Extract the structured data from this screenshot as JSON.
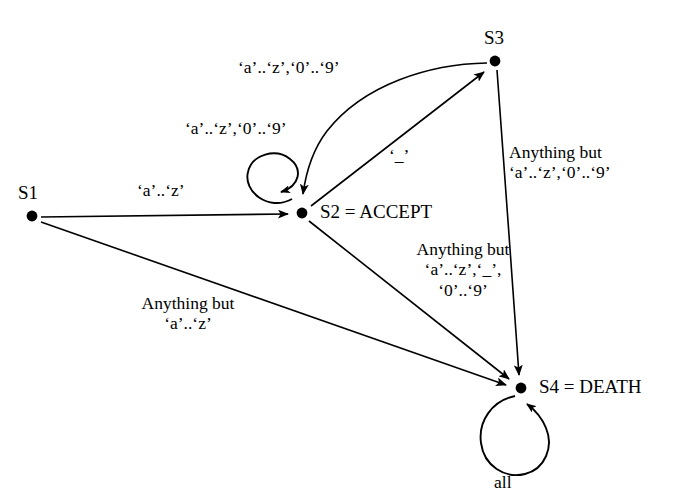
{
  "diagram": {
    "kind": "state-transition-diagram",
    "background_color": "#ffffff",
    "stroke_color": "#000000",
    "nodes": [
      {
        "id": "S1",
        "label": "S1",
        "x": 32,
        "y": 216
      },
      {
        "id": "S2",
        "label": "S2 = ACCEPT",
        "x": 302,
        "y": 213
      },
      {
        "id": "S3",
        "label": "S3",
        "x": 495,
        "y": 61
      },
      {
        "id": "S4",
        "label": "S4 = DEATH",
        "x": 521,
        "y": 388
      }
    ],
    "edges": [
      {
        "id": "s1-s2",
        "from": "S1",
        "to": "S2",
        "label_lines": [
          "‘a’..‘z’"
        ]
      },
      {
        "id": "s1-s4",
        "from": "S1",
        "to": "S4",
        "label_lines": [
          "Anything but",
          "‘a’..‘z’"
        ]
      },
      {
        "id": "s2-self",
        "from": "S2",
        "to": "S2",
        "label_lines": [
          "‘a’..‘z’,‘0’..‘9’"
        ]
      },
      {
        "id": "s2-s3",
        "from": "S2",
        "to": "S3",
        "label_lines": [
          "‘_’"
        ]
      },
      {
        "id": "s3-s2",
        "from": "S3",
        "to": "S2",
        "label_lines": [
          "‘a’..‘z’,‘0’..‘9’"
        ]
      },
      {
        "id": "s2-s4",
        "from": "S2",
        "to": "S4",
        "label_lines": [
          "Anything but",
          "‘a’..‘z’,‘_’,",
          "‘0’..‘9’"
        ]
      },
      {
        "id": "s3-s4",
        "from": "S3",
        "to": "S4",
        "label_lines": [
          "Anything but",
          "‘a’..‘z’,‘0’..‘9’"
        ]
      },
      {
        "id": "s4-self",
        "from": "S4",
        "to": "S4",
        "label_lines": [
          "all"
        ]
      }
    ],
    "labels": {
      "node_s1": "S1",
      "node_s2": "S2 = ACCEPT",
      "node_s3": "S3",
      "node_s4": "S4 = DEATH",
      "edge_s1_s2": "‘a’..‘z’",
      "edge_s1_s4_line1": "Anything but",
      "edge_s1_s4_line2": "‘a’..‘z’",
      "edge_s2_self": "‘a’..‘z’,‘0’..‘9’",
      "edge_s3_s2": "‘a’..‘z’,‘0’..‘9’",
      "edge_s2_s3": "‘_’",
      "edge_s2_s4_line1": "Anything but",
      "edge_s2_s4_line2": "‘a’..‘z’,‘_’,",
      "edge_s2_s4_line3": "‘0’..‘9’",
      "edge_s3_s4_line1": "Anything but",
      "edge_s3_s4_line2": "‘a’..‘z’,‘0’..‘9’",
      "edge_s4_self": "all"
    }
  }
}
